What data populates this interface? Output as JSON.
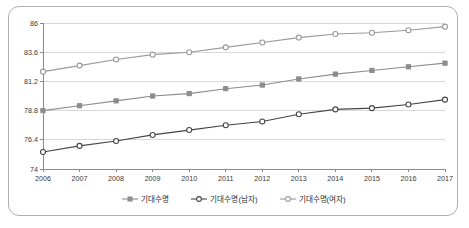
{
  "chart_data": {
    "type": "line",
    "title": "",
    "xlabel": "",
    "ylabel": "",
    "categories": [
      "2006",
      "2007",
      "2008",
      "2009",
      "2010",
      "2011",
      "2012",
      "2013",
      "2014",
      "2015",
      "2016",
      "2017"
    ],
    "x_tick_labels": [
      "2006",
      "2007",
      "2008",
      "2009",
      "2010",
      "2011",
      "2012",
      "2013",
      "2014",
      "2015",
      "2016",
      "2017"
    ],
    "y_tick_labels": [
      "74",
      "76.4",
      "78.8",
      "81.2",
      "83.6",
      "86"
    ],
    "y_ticks": [
      74,
      76.4,
      78.8,
      81.2,
      83.6,
      86
    ],
    "ylim": [
      74,
      86
    ],
    "grid": true,
    "legend_position": "bottom",
    "series": [
      {
        "name": "기대수명",
        "marker": "filled-square",
        "color": "#8c8c8c",
        "values": [
          78.8,
          79.2,
          79.6,
          80.0,
          80.2,
          80.6,
          80.9,
          81.4,
          81.8,
          82.1,
          82.4,
          82.7
        ]
      },
      {
        "name": "기대수명(남자)",
        "marker": "open-circle",
        "color": "#454545",
        "values": [
          75.4,
          75.9,
          76.3,
          76.8,
          77.2,
          77.6,
          77.9,
          78.5,
          78.9,
          79.0,
          79.3,
          79.7
        ]
      },
      {
        "name": "기대수명(여자)",
        "marker": "open-circle",
        "color": "#9a9a9a",
        "values": [
          82.0,
          82.5,
          83.0,
          83.4,
          83.6,
          84.0,
          84.4,
          84.8,
          85.1,
          85.2,
          85.4,
          85.7
        ]
      }
    ],
    "legend": [
      {
        "label": "기대수명",
        "marker": "filled-square",
        "color": "#8c8c8c"
      },
      {
        "label": "기대수명(남자)",
        "marker": "open-circle",
        "color": "#454545"
      },
      {
        "label": "기대수명(여자)",
        "marker": "open-circle",
        "color": "#9a9a9a"
      }
    ],
    "colors": {
      "grid": "#d8d8d8",
      "axis": "#8a8a8a",
      "border": "#b0b0b0",
      "background": "#ffffff"
    }
  }
}
